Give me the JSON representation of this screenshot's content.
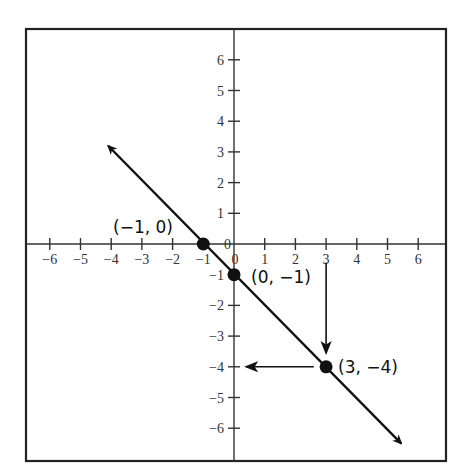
{
  "chart_data": {
    "type": "line",
    "title": "",
    "xlabel": "",
    "ylabel": "",
    "xlim": [
      -6.8,
      6.8
    ],
    "ylim": [
      -7.0,
      7.0
    ],
    "grid": false,
    "x_ticks": [
      -6,
      -5,
      -4,
      -3,
      -2,
      -1,
      0,
      1,
      2,
      3,
      4,
      5,
      6
    ],
    "y_ticks": [
      -6,
      -5,
      -4,
      -3,
      -2,
      -1,
      0,
      1,
      2,
      3,
      4,
      5,
      6
    ],
    "x_tick_labels": [
      "−6",
      "−5",
      "−4",
      "−3",
      "−2",
      "−1",
      "0",
      "1",
      "2",
      "3",
      "4",
      "5",
      "6"
    ],
    "y_tick_labels": [
      "−6",
      "−5",
      "−4",
      "−3",
      "−2",
      "−1",
      "0",
      "1",
      "2",
      "3",
      "4",
      "5",
      "6"
    ],
    "series": [
      {
        "name": "y = −x − 1",
        "equation": "y = -x - 1",
        "slope": -1,
        "intercept": -1,
        "arrow_start": {
          "x": -4.1,
          "y": 3.2
        },
        "arrow_end": {
          "x": 5.45,
          "y": -6.5
        }
      }
    ],
    "points": [
      {
        "x": -1,
        "y": 0,
        "label": "(−1, 0)"
      },
      {
        "x": 0,
        "y": -1,
        "label": "(0, −1)"
      },
      {
        "x": 3,
        "y": -4,
        "label": "(3, −4)"
      }
    ],
    "annotations": [
      {
        "type": "arrow",
        "from": {
          "x": 3,
          "y": -0.6
        },
        "to": {
          "x": 3,
          "y": -3.55
        },
        "description": "vertical arrow from x=3 down to the line"
      },
      {
        "type": "arrow",
        "from": {
          "x": 2.6,
          "y": -4
        },
        "to": {
          "x": 0.4,
          "y": -4
        },
        "description": "horizontal arrow from the point (3,−4) left to the y-axis"
      }
    ]
  },
  "colors": {
    "line": "#111111",
    "axis": "#333333",
    "frame": "#222222",
    "text": "#333333",
    "background": "#ffffff"
  },
  "labels": {
    "p1": "(−1, 0)",
    "p2": "(0, −1)",
    "p3": "(3, −4)"
  }
}
